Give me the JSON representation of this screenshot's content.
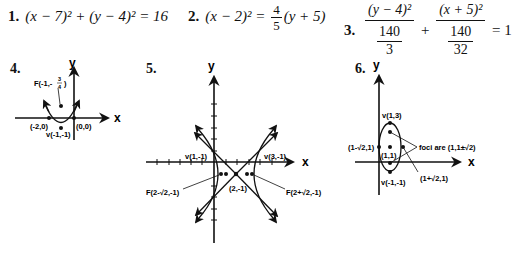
{
  "problems": [
    {
      "num": "1.",
      "equation": "(x − 7)² + (y − 4)² = 16"
    },
    {
      "num": "2.",
      "lhs": "(x − 2)² =",
      "coef_num": "4",
      "coef_den": "5",
      "rhs": "(y + 5)"
    },
    {
      "num": "3.",
      "term1_num": "(y − 4)²",
      "term1_den_num": "140",
      "term1_den_den": "3",
      "plus": "+",
      "term2_num": "(x + 5)²",
      "term2_den_num": "140",
      "term2_den_den": "32",
      "rhs": "= 1"
    }
  ],
  "graphs": [
    {
      "num": "4.",
      "type": "parabola",
      "x_axis": "x",
      "y_axis": "y",
      "labels": {
        "focus": "F(-1,-",
        "focus_frac_num": "3",
        "focus_frac_den": "4",
        "focus_close": ")",
        "left_intercept": "(-2,0)",
        "right_intercept": "(0,0)",
        "vertex": "v(-1,-1)"
      }
    },
    {
      "num": "5.",
      "type": "hyperbola",
      "x_axis": "x",
      "y_axis": "y",
      "labels": {
        "left_vertex": "v(1,-1)",
        "right_vertex": "v(3,-1)",
        "center": "(2,-1)",
        "left_focus": "F(2-√2,-1)",
        "right_focus": "F(2+√2,-1)"
      }
    },
    {
      "num": "6.",
      "type": "ellipse",
      "x_axis": "x",
      "y_axis": "y",
      "labels": {
        "top_vertex": "v(1,3)",
        "bottom_vertex": "v(-1,-1)",
        "center": "(1,1)",
        "left_point": "(1-√2,1)",
        "right_point": "(1+√2,1)",
        "foci_note": "foci are (1,1±√2)"
      }
    }
  ]
}
